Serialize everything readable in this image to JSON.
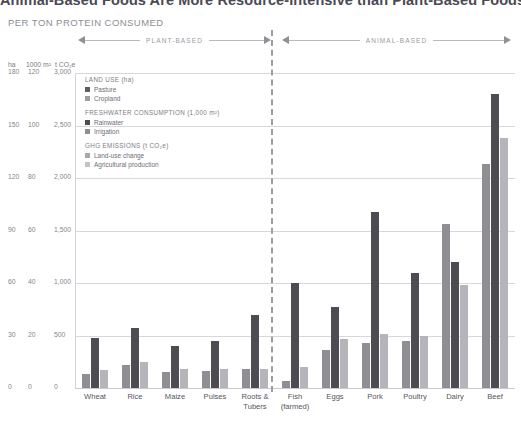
{
  "headline": "Animal-Based Foods Are More Resource-Intensive than Plant-Based Foods",
  "subhead": "PER TON PROTEIN CONSUMED",
  "sections": {
    "plant": "PLANT-BASED",
    "animal": "ANIMAL-BASED"
  },
  "axis_headers": {
    "ha": "ha",
    "m2": "1000 m²",
    "co2": "t CO₂e"
  },
  "legend": {
    "blocks": [
      {
        "title": "LAND USE (ha)",
        "items": [
          {
            "label": "Pasture",
            "color": "#5d5d63"
          },
          {
            "label": "Cropland",
            "color": "#9c9ca2"
          }
        ]
      },
      {
        "title": "FRESHWATER CONSUMPTION (1,000 m²)",
        "items": [
          {
            "label": "Rainwater",
            "color": "#4c4c52"
          },
          {
            "label": "Irrigation",
            "color": "#8e8e94"
          }
        ]
      },
      {
        "title": "GHG EMISSIONS (t CO₂e)",
        "items": [
          {
            "label": "Land-use change",
            "color": "#a8a8ae"
          },
          {
            "label": "Agricultural production",
            "color": "#c2c2c8"
          }
        ]
      }
    ]
  },
  "chart_data": {
    "type": "bar",
    "title": "Animal-Based Foods Are More Resource-Intensive than Plant-Based Foods",
    "subtitle": "PER TON PROTEIN CONSUMED",
    "xlabel": "",
    "ylabel": "",
    "grid": true,
    "legend_position": "inside-top-left",
    "categories": [
      "Wheat",
      "Rice",
      "Maize",
      "Pulses",
      "Roots &\nTubers",
      "Fish\n(farmed)",
      "Eggs",
      "Pork",
      "Poultry",
      "Dairy",
      "Beef"
    ],
    "axes": [
      {
        "name": "Land use",
        "unit": "ha",
        "ticks": [
          0,
          30,
          60,
          90,
          120,
          150,
          180
        ],
        "max": 180
      },
      {
        "name": "Freshwater consumption",
        "unit": "1000 m²",
        "ticks": [
          0,
          20,
          40,
          60,
          80,
          100,
          120
        ],
        "max": 120
      },
      {
        "name": "GHG emissions",
        "unit": "t CO₂e",
        "ticks": [
          0,
          500,
          1000,
          1500,
          2000,
          2500,
          3000
        ],
        "max": 3000
      }
    ],
    "tick_rows": [
      {
        "ha": "180",
        "m2": "120",
        "co2": "3,000"
      },
      {
        "ha": "150",
        "m2": "100",
        "co2": "2,500"
      },
      {
        "ha": "120",
        "m2": "80",
        "co2": "2,000"
      },
      {
        "ha": "90",
        "m2": "60",
        "co2": "1,500"
      },
      {
        "ha": "60",
        "m2": "40",
        "co2": "1,000"
      },
      {
        "ha": "30",
        "m2": "20",
        "co2": "500"
      },
      {
        "ha": "0",
        "m2": "0",
        "co2": "0"
      }
    ],
    "series": [
      {
        "name": "Land use",
        "unit": "ha",
        "color": "#8e8e94",
        "values": [
          8,
          13,
          9,
          10,
          11,
          4,
          22,
          26,
          27,
          94,
          128
        ]
      },
      {
        "name": "Freshwater consumption",
        "unit": "1000 m²",
        "color": "#4c4c52",
        "values": [
          19,
          23,
          16,
          18,
          28,
          40,
          31,
          67,
          44,
          48,
          112
        ]
      },
      {
        "name": "GHG emissions",
        "unit": "t CO₂e",
        "color": "#b4b4ba",
        "values": [
          170,
          250,
          180,
          180,
          180,
          200,
          470,
          510,
          500,
          980,
          2380
        ]
      }
    ]
  }
}
